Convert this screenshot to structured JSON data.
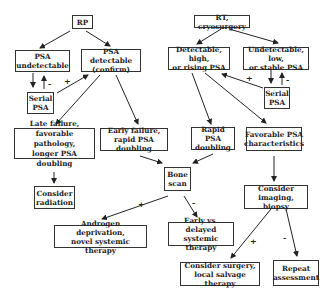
{
  "nodes": {
    "rp": "RP",
    "psa_undetectable": "PSA\nundetectable",
    "psa_detectable": "PSA detectable\n(confirm)",
    "serial_psa_left": "Serial\nPSA",
    "late_failure": "Late failure,\nfavorable pathology,\nlonger PSA doubling",
    "consider_radiation": "Consider\nradiation",
    "early_failure": "Early failure,\nrapid PSA doubling",
    "rt_cryo": "RT, cryosurgery",
    "detectable_high": "Detectable, high,\nor rising PSA",
    "undetectable_low": "Undetectable, low,\nor stable PSA",
    "serial_psa_right": "Serial\nPSA",
    "rapid_psa": "Rapid PSA\ndoubling",
    "favorable_psa": "Favorable PSA\ncharacteristics",
    "bone_scan": "Bone\nscan",
    "androgen": "Androgen deprivation,\nnovel systemic therapy",
    "early_vs_delayed": "Early vs. delayed\nsystemic therapy",
    "consider_imaging": "Consider\nimaging, biopsy",
    "consider_surgery": "Consider surgery,\nlocal salvage therapy",
    "repeat_assessment": "Repeat\nassessment"
  },
  "edge_labels": {
    "plus": "+",
    "minus": "-"
  }
}
